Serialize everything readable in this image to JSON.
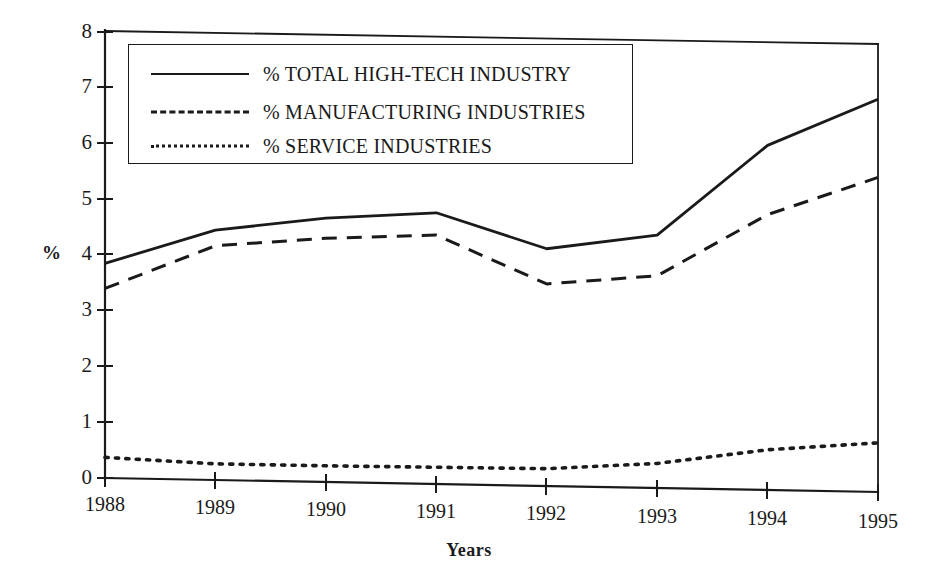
{
  "chart_data": {
    "type": "line",
    "title": "",
    "xlabel": "Years",
    "ylabel": "%",
    "categories": [
      "1988",
      "1989",
      "1990",
      "1991",
      "1992",
      "1993",
      "1994",
      "1995"
    ],
    "x": [
      1988,
      1989,
      1990,
      1991,
      1992,
      1993,
      1994,
      1995
    ],
    "xlim": [
      1988,
      1995
    ],
    "ylim": [
      0,
      8
    ],
    "yticks": [
      "0",
      "1",
      "2",
      "3",
      "4",
      "5",
      "6",
      "7",
      "8"
    ],
    "ytick_values": [
      0,
      1,
      2,
      3,
      4,
      5,
      6,
      7,
      8
    ],
    "grid": false,
    "legend_position": "upper-left-inside",
    "series": [
      {
        "name": "% TOTAL HIGH-TECH INDUSTRY",
        "style": "solid",
        "values": [
          3.85,
          4.48,
          4.73,
          4.86,
          4.25,
          4.53,
          6.17,
          7.03
        ]
      },
      {
        "name": "% MANUFACTURING INDUSTRIES",
        "style": "dashed",
        "values": [
          3.4,
          4.2,
          4.37,
          4.46,
          3.62,
          3.8,
          4.93,
          5.63
        ]
      },
      {
        "name": "% SERVICE INDUSTRIES",
        "style": "dotted",
        "values": [
          0.37,
          0.29,
          0.29,
          0.3,
          0.31,
          0.44,
          0.72,
          0.88
        ]
      }
    ]
  },
  "legend": {
    "items": [
      {
        "label": "% TOTAL HIGH-TECH INDUSTRY",
        "style": "solid"
      },
      {
        "label": "% MANUFACTURING INDUSTRIES",
        "style": "dashed"
      },
      {
        "label": "% SERVICE INDUSTRIES",
        "style": "dotted"
      }
    ]
  },
  "axes": {
    "y_title": "%",
    "x_title": "Years",
    "y_ticks": [
      "8",
      "7",
      "6",
      "5",
      "4",
      "3",
      "2",
      "1",
      "0"
    ],
    "x_ticks": [
      "1988",
      "1989",
      "1990",
      "1991",
      "1992",
      "1993",
      "1994",
      "1995"
    ]
  },
  "colors": {
    "ink": "#1a1a1a",
    "paper": "#ffffff"
  }
}
